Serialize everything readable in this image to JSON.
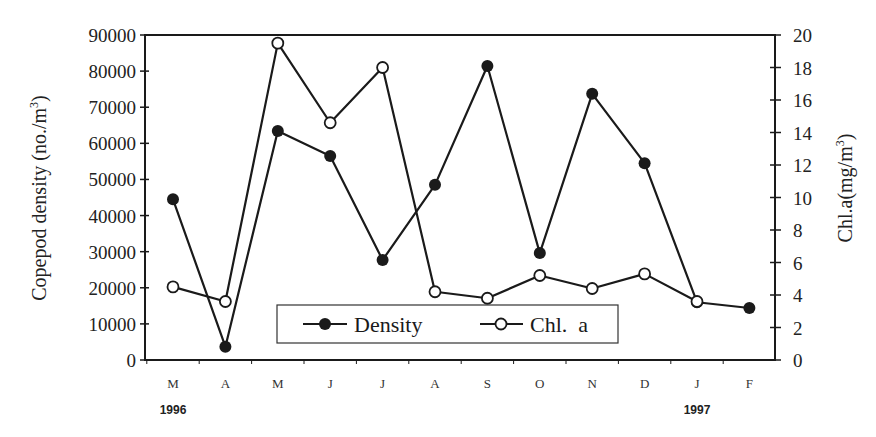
{
  "chart_data": {
    "type": "line",
    "title": "",
    "x": [
      "M",
      "A",
      "M",
      "J",
      "J",
      "A",
      "S",
      "O",
      "N",
      "D",
      "J",
      "F"
    ],
    "year_labels": [
      {
        "label": "1996",
        "at_index": 0
      },
      {
        "label": "1997",
        "at_index": 10
      }
    ],
    "xlabel": "",
    "ylabel_left": "Copepod density (no./m3)",
    "ylabel_right": "Chl.a(mg/m3)",
    "ylim_left": [
      0,
      90000
    ],
    "ylim_right": [
      0,
      20
    ],
    "yticks_left": [
      0,
      10000,
      20000,
      30000,
      40000,
      50000,
      60000,
      70000,
      80000,
      90000
    ],
    "yticks_right": [
      0,
      2,
      4,
      6,
      8,
      10,
      12,
      14,
      16,
      18,
      20
    ],
    "grid": false,
    "legend_position": "bottom-center-inside",
    "series": [
      {
        "name": "Density",
        "axis": "left",
        "marker": "filled-circle",
        "values": [
          44500,
          3700,
          63400,
          56500,
          27700,
          48500,
          81400,
          29600,
          73700,
          54500,
          16000,
          14400
        ]
      },
      {
        "name": "Chl. a",
        "axis": "right",
        "marker": "open-circle",
        "values": [
          4.5,
          3.6,
          19.5,
          14.6,
          18.0,
          4.2,
          3.8,
          5.2,
          4.4,
          5.3,
          3.6,
          null
        ]
      }
    ]
  },
  "legend": {
    "density_label": "Density",
    "chl_label": "Chl.  a"
  },
  "axes": {
    "left_title_main": "Copepod density (no./m",
    "left_title_sup": "3",
    "left_title_close": ")",
    "right_title_main": "Chl.a(mg/m",
    "right_title_sup": "3",
    "right_title_close": ")"
  }
}
